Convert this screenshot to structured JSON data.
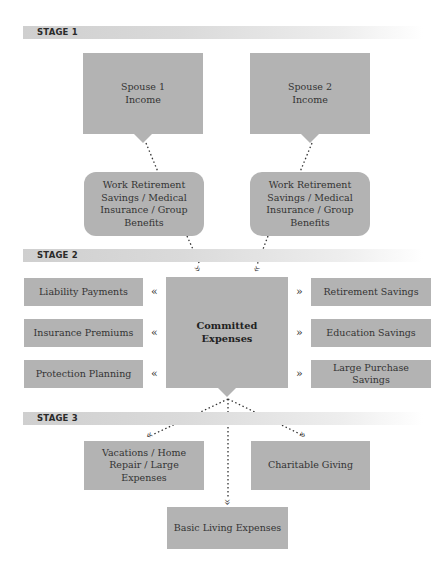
{
  "stages": [
    {
      "label": "STAGE 1"
    },
    {
      "label": "STAGE 2"
    },
    {
      "label": "STAGE 3"
    }
  ],
  "stage1": {
    "income_boxes": [
      "Spouse 1\nIncome",
      "Spouse 2\nIncome"
    ],
    "spouse1_line1": "Spouse 1",
    "spouse1_line2": "Income",
    "spouse2_line1": "Spouse 2",
    "spouse2_line2": "Income",
    "benefits_boxes": [
      "Work Retirement Savings / Medical Insurance / Group Benefits",
      "Work Retirement Savings / Medical Insurance / Group Benefits"
    ]
  },
  "stage2": {
    "center": "Committed Expenses",
    "left": [
      "Liability Payments",
      "Insurance Premiums",
      "Protection Planning"
    ],
    "right": [
      "Retirement Savings",
      "Education Savings",
      "Large Purchase Savings"
    ],
    "left_arrow": "«",
    "right_arrow": "»"
  },
  "stage3": {
    "left": "Vacations / Home Repair / Large Expenses",
    "right": "Charitable Giving",
    "bottom": "Basic Living Expenses"
  },
  "colors": {
    "box": "#b3b3b3",
    "band": "#d4d4d4",
    "text": "#333333"
  }
}
